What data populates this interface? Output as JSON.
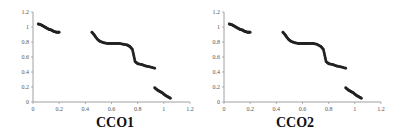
{
  "chart_data": [
    {
      "type": "scatter",
      "title": "CCO1",
      "xlabel": "",
      "ylabel": "",
      "xlim": [
        0,
        1.2
      ],
      "ylim": [
        0,
        1.2
      ],
      "x_ticks": [
        "0",
        "0.2",
        "0.4",
        "0.6",
        "0.8",
        "1",
        "1.2"
      ],
      "y_ticks": [
        "0",
        "0.2",
        "0.4",
        "0.6",
        "0.8",
        "1",
        "1.2"
      ],
      "grid": false,
      "marker_color": "#222222",
      "series": [
        {
          "name": "segment-1",
          "x": [
            0.04,
            0.06,
            0.08,
            0.1,
            0.12,
            0.14,
            0.16,
            0.18,
            0.2
          ],
          "y": [
            1.04,
            1.03,
            1.01,
            0.99,
            0.97,
            0.96,
            0.94,
            0.93,
            0.93
          ]
        },
        {
          "name": "segment-2",
          "x": [
            0.45,
            0.47,
            0.49,
            0.51,
            0.54,
            0.57,
            0.6,
            0.63,
            0.66,
            0.69,
            0.72,
            0.74,
            0.76,
            0.77,
            0.78,
            0.8,
            0.83,
            0.86,
            0.89,
            0.93
          ],
          "y": [
            0.93,
            0.89,
            0.84,
            0.81,
            0.79,
            0.78,
            0.78,
            0.78,
            0.78,
            0.77,
            0.76,
            0.74,
            0.7,
            0.62,
            0.54,
            0.51,
            0.5,
            0.48,
            0.47,
            0.45
          ]
        },
        {
          "name": "segment-3",
          "x": [
            0.93,
            0.95,
            0.97,
            0.99,
            1.01,
            1.03,
            1.05
          ],
          "y": [
            0.19,
            0.16,
            0.14,
            0.12,
            0.09,
            0.07,
            0.05
          ]
        }
      ]
    },
    {
      "type": "scatter",
      "title": "CCO2",
      "xlabel": "",
      "ylabel": "",
      "xlim": [
        0,
        1.2
      ],
      "ylim": [
        0,
        1.2
      ],
      "x_ticks": [
        "0",
        "0.2",
        "0.4",
        "0.6",
        "0.8",
        "1",
        "1.2"
      ],
      "y_ticks": [
        "0",
        "0.2",
        "0.4",
        "0.6",
        "0.8",
        "1",
        "1.2"
      ],
      "grid": false,
      "marker_color": "#222222",
      "series": [
        {
          "name": "segment-1",
          "x": [
            0.04,
            0.06,
            0.08,
            0.1,
            0.12,
            0.14,
            0.16,
            0.18,
            0.2
          ],
          "y": [
            1.04,
            1.03,
            1.01,
            0.99,
            0.97,
            0.96,
            0.94,
            0.93,
            0.93
          ]
        },
        {
          "name": "segment-2",
          "x": [
            0.45,
            0.47,
            0.49,
            0.51,
            0.54,
            0.57,
            0.6,
            0.62,
            0.65,
            0.68,
            0.71,
            0.74,
            0.76,
            0.77,
            0.78,
            0.8,
            0.83,
            0.86,
            0.89,
            0.93
          ],
          "y": [
            0.93,
            0.89,
            0.84,
            0.81,
            0.79,
            0.78,
            0.78,
            0.78,
            0.78,
            0.78,
            0.77,
            0.74,
            0.7,
            0.62,
            0.54,
            0.51,
            0.5,
            0.48,
            0.47,
            0.45
          ]
        },
        {
          "name": "segment-3",
          "x": [
            0.93,
            0.95,
            0.97,
            0.99,
            1.01,
            1.03,
            1.05
          ],
          "y": [
            0.19,
            0.16,
            0.14,
            0.12,
            0.09,
            0.07,
            0.05
          ]
        }
      ]
    }
  ],
  "captions": {
    "left": "CCO1",
    "right": "CCO2"
  }
}
